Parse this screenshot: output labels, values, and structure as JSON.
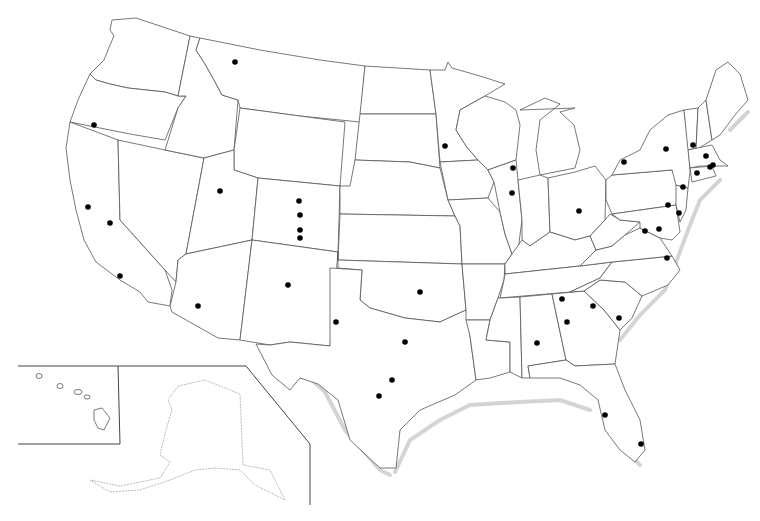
{
  "map": {
    "title": "United States city locations",
    "background": "#ffffff",
    "outline_color": "#555555",
    "dot_color": "#000000",
    "dot_radius": 2.8,
    "insets": [
      {
        "name": "hawaii-inset",
        "label": "Hawaii"
      },
      {
        "name": "alaska-inset",
        "label": "Alaska"
      }
    ],
    "city_dots": [
      {
        "state": "MT",
        "x": 235,
        "y": 62
      },
      {
        "state": "OR",
        "x": 94,
        "y": 125
      },
      {
        "state": "CA",
        "x": 88,
        "y": 207
      },
      {
        "state": "CA",
        "x": 110,
        "y": 223
      },
      {
        "state": "CA",
        "x": 120,
        "y": 276
      },
      {
        "state": "UT",
        "x": 220,
        "y": 191
      },
      {
        "state": "CO",
        "x": 299,
        "y": 201
      },
      {
        "state": "CO",
        "x": 300,
        "y": 215
      },
      {
        "state": "CO",
        "x": 300,
        "y": 230
      },
      {
        "state": "CO",
        "x": 300,
        "y": 238
      },
      {
        "state": "AZ",
        "x": 198,
        "y": 306
      },
      {
        "state": "NM",
        "x": 288,
        "y": 285
      },
      {
        "state": "TX",
        "x": 336,
        "y": 322
      },
      {
        "state": "OK",
        "x": 420,
        "y": 292
      },
      {
        "state": "TX",
        "x": 405,
        "y": 342
      },
      {
        "state": "TX",
        "x": 392,
        "y": 380
      },
      {
        "state": "TX",
        "x": 379,
        "y": 396
      },
      {
        "state": "MN",
        "x": 445,
        "y": 146
      },
      {
        "state": "WI",
        "x": 513,
        "y": 168
      },
      {
        "state": "IL",
        "x": 512,
        "y": 193
      },
      {
        "state": "OH",
        "x": 579,
        "y": 211
      },
      {
        "state": "NY",
        "x": 624,
        "y": 162
      },
      {
        "state": "NY",
        "x": 666,
        "y": 149
      },
      {
        "state": "NH",
        "x": 693,
        "y": 145
      },
      {
        "state": "MA",
        "x": 706,
        "y": 156
      },
      {
        "state": "MA",
        "x": 713,
        "y": 165
      },
      {
        "state": "RI",
        "x": 710,
        "y": 167
      },
      {
        "state": "CT",
        "x": 697,
        "y": 173
      },
      {
        "state": "NY",
        "x": 683,
        "y": 187
      },
      {
        "state": "PA",
        "x": 668,
        "y": 205
      },
      {
        "state": "NJ",
        "x": 679,
        "y": 213
      },
      {
        "state": "VA",
        "x": 645,
        "y": 231
      },
      {
        "state": "MD",
        "x": 659,
        "y": 229
      },
      {
        "state": "VA",
        "x": 667,
        "y": 258
      },
      {
        "state": "TN",
        "x": 562,
        "y": 299
      },
      {
        "state": "GA",
        "x": 567,
        "y": 322
      },
      {
        "state": "SC",
        "x": 593,
        "y": 306
      },
      {
        "state": "SC",
        "x": 619,
        "y": 318
      },
      {
        "state": "AL",
        "x": 537,
        "y": 343
      },
      {
        "state": "FL",
        "x": 605,
        "y": 415
      },
      {
        "state": "FL",
        "x": 641,
        "y": 444
      }
    ]
  }
}
